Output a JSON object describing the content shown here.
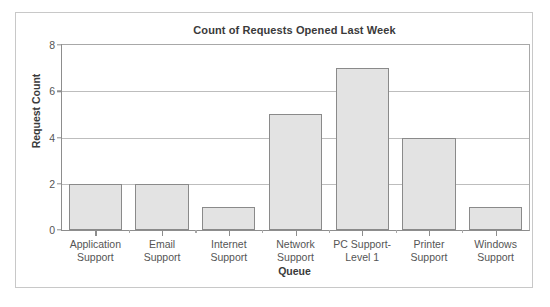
{
  "chart_data": {
    "type": "bar",
    "title": "Count of Requests Opened Last Week",
    "xlabel": "Queue",
    "ylabel": "Request Count",
    "categories": [
      "Application Support",
      "Email Support",
      "Internet Support",
      "Network Support",
      "PC Support-Level 1",
      "Printer Support",
      "Windows Support"
    ],
    "category_lines": [
      [
        "Application",
        "Support"
      ],
      [
        "Email",
        "Support"
      ],
      [
        "Internet",
        "Support"
      ],
      [
        "Network",
        "Support"
      ],
      [
        "PC Support-",
        "Level 1"
      ],
      [
        "Printer",
        "Support"
      ],
      [
        "Windows",
        "Support"
      ]
    ],
    "values": [
      2,
      2,
      1,
      5,
      7,
      4,
      1
    ],
    "ylim": [
      0,
      8
    ],
    "yticks": [
      0,
      2,
      4,
      6,
      8
    ],
    "ytick_labels": [
      "0",
      "2",
      "4",
      "6",
      "8"
    ],
    "grid": true,
    "legend": false,
    "bar_fill_color": "#e3e3e3",
    "bar_edge_color": "#8a8a8a",
    "gridline_color": "#bdbdbd",
    "axis_color": "#8d8d8d",
    "text_color": "#3a3a3a",
    "tick_text_color": "#555555",
    "background_color": "#ffffff",
    "frame_border_color": "#c8c8c8"
  }
}
